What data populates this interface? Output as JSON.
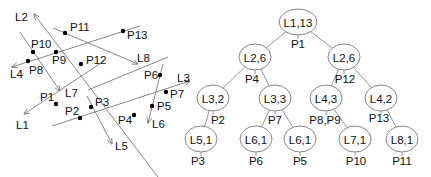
{
  "left_diagram": {
    "lines": [
      {
        "id": "L1",
        "x1": 104,
        "y1": 61,
        "x2": 24,
        "y2": 114,
        "arrow": "end",
        "label": "L1",
        "lx": 16,
        "ly": 129
      },
      {
        "id": "L2",
        "x1": 158,
        "y1": 177,
        "x2": 34,
        "y2": 14,
        "arrow": "end",
        "label": "L2",
        "lx": 15,
        "ly": 21
      },
      {
        "id": "L3",
        "x1": 52,
        "y1": 126,
        "x2": 190,
        "y2": 81,
        "arrow": "end",
        "label": "L3",
        "lx": 177,
        "ly": 82
      },
      {
        "id": "L4",
        "x1": 140,
        "y1": 26,
        "x2": 12,
        "y2": 67,
        "arrow": "end",
        "label": "L4",
        "lx": 10,
        "ly": 78
      },
      {
        "id": "L5",
        "x1": 87,
        "y1": 96,
        "x2": 112,
        "y2": 144,
        "arrow": "end",
        "label": "L5",
        "lx": 115,
        "ly": 150
      },
      {
        "id": "L6",
        "x1": 163,
        "y1": 64,
        "x2": 148,
        "y2": 123,
        "arrow": "end",
        "label": "L6",
        "lx": 152,
        "ly": 128
      },
      {
        "id": "L7",
        "x1": 20,
        "y1": 32,
        "x2": 60,
        "y2": 91,
        "arrow": "end",
        "label": "L7",
        "lx": 65,
        "ly": 97
      },
      {
        "id": "L8",
        "x1": 53,
        "y1": 28,
        "x2": 138,
        "y2": 64,
        "arrow": "end",
        "label": "L8",
        "lx": 137,
        "ly": 62
      },
      {
        "id": "L8b",
        "x1": 88,
        "y1": 90,
        "x2": 168,
        "y2": 57,
        "arrow": "none",
        "label": "",
        "lx": 0,
        "ly": 0
      }
    ],
    "points": [
      {
        "id": "P1",
        "x": 56,
        "y": 104,
        "label": "P1",
        "lx": 40,
        "ly": 101
      },
      {
        "id": "P2",
        "x": 80,
        "y": 118,
        "label": "P2",
        "lx": 65,
        "ly": 115
      },
      {
        "id": "P3",
        "x": 91,
        "y": 107,
        "label": "P3",
        "lx": 95,
        "ly": 106
      },
      {
        "id": "P4",
        "x": 134,
        "y": 115,
        "label": "P4",
        "lx": 118,
        "ly": 124
      },
      {
        "id": "P5",
        "x": 152,
        "y": 106,
        "label": "P5",
        "lx": 157,
        "ly": 110
      },
      {
        "id": "P6",
        "x": 160,
        "y": 75,
        "label": "P6",
        "lx": 144,
        "ly": 79
      },
      {
        "id": "P7",
        "x": 166,
        "y": 92,
        "label": "P7",
        "lx": 170,
        "ly": 98
      },
      {
        "id": "P8",
        "x": 28,
        "y": 61,
        "label": "P8",
        "lx": 29,
        "ly": 74
      },
      {
        "id": "P9",
        "x": 56,
        "y": 52,
        "label": "P9",
        "lx": 52,
        "ly": 64
      },
      {
        "id": "P10",
        "x": 33,
        "y": 52,
        "label": "P10",
        "lx": 31,
        "ly": 48
      },
      {
        "id": "P11",
        "x": 65,
        "y": 33,
        "label": "P11",
        "lx": 70,
        "ly": 31
      },
      {
        "id": "P12",
        "x": 81,
        "y": 64,
        "label": "P12",
        "lx": 86,
        "ly": 64
      },
      {
        "id": "P13",
        "x": 123,
        "y": 31,
        "label": "P13",
        "lx": 127,
        "ly": 39
      }
    ]
  },
  "tree": {
    "nodes": [
      {
        "id": "n0",
        "label": "L1,13",
        "cx": 298,
        "cy": 22,
        "rx": 19,
        "ry": 13,
        "edge_label": "P1",
        "ex": 298,
        "ey": 48
      },
      {
        "id": "n1",
        "label": "L2,6",
        "cx": 255,
        "cy": 57,
        "rx": 16,
        "ry": 13,
        "edge_label": "P4",
        "ex": 252,
        "ey": 83
      },
      {
        "id": "n2",
        "label": "L2,6",
        "cx": 344,
        "cy": 57,
        "rx": 16,
        "ry": 13,
        "edge_label": "P12",
        "ex": 345,
        "ey": 83
      },
      {
        "id": "n3",
        "label": "L3,2",
        "cx": 213,
        "cy": 98,
        "rx": 16,
        "ry": 13,
        "edge_label": "P2",
        "ex": 218,
        "ey": 124
      },
      {
        "id": "n4",
        "label": "L3,3",
        "cx": 275,
        "cy": 98,
        "rx": 16,
        "ry": 13,
        "edge_label": "P7",
        "ex": 275,
        "ey": 124
      },
      {
        "id": "n5",
        "label": "L4,3",
        "cx": 326,
        "cy": 98,
        "rx": 16,
        "ry": 13,
        "edge_label": "P8,P9",
        "ex": 325,
        "ey": 124
      },
      {
        "id": "n6",
        "label": "L4,2",
        "cx": 381,
        "cy": 98,
        "rx": 16,
        "ry": 13,
        "edge_label": "P13",
        "ex": 379,
        "ey": 122
      },
      {
        "id": "n7",
        "label": "L5,1",
        "cx": 201,
        "cy": 139,
        "rx": 16,
        "ry": 13,
        "edge_label": "P3",
        "ex": 198,
        "ey": 165
      },
      {
        "id": "n8",
        "label": "L6,1",
        "cx": 256,
        "cy": 139,
        "rx": 16,
        "ry": 13,
        "edge_label": "P6",
        "ex": 256,
        "ey": 165
      },
      {
        "id": "n9",
        "label": "L6,1",
        "cx": 300,
        "cy": 139,
        "rx": 16,
        "ry": 13,
        "edge_label": "P5",
        "ex": 300,
        "ey": 165
      },
      {
        "id": "n10",
        "label": "L7,1",
        "cx": 355,
        "cy": 139,
        "rx": 16,
        "ry": 13,
        "edge_label": "P10",
        "ex": 356,
        "ey": 165
      },
      {
        "id": "n11",
        "label": "L8,1",
        "cx": 402,
        "cy": 139,
        "rx": 16,
        "ry": 13,
        "edge_label": "P11",
        "ex": 402,
        "ey": 165
      }
    ],
    "edges": [
      [
        "n0",
        "n1"
      ],
      [
        "n0",
        "n2"
      ],
      [
        "n1",
        "n3"
      ],
      [
        "n1",
        "n4"
      ],
      [
        "n2",
        "n5"
      ],
      [
        "n2",
        "n6"
      ],
      [
        "n3",
        "n7"
      ],
      [
        "n4",
        "n8"
      ],
      [
        "n4",
        "n9"
      ],
      [
        "n5",
        "n10"
      ],
      [
        "n6",
        "n11"
      ]
    ]
  }
}
